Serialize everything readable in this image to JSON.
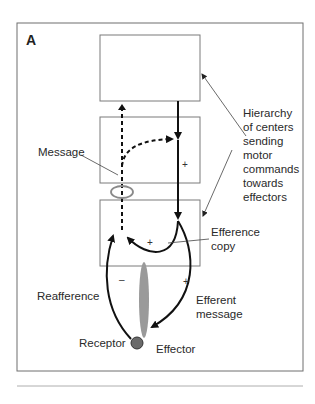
{
  "figure": {
    "panel_label": "A",
    "boxes": [
      {
        "id": "center-top",
        "level": 1
      },
      {
        "id": "center-middle",
        "level": 2
      },
      {
        "id": "center-bottom",
        "level": 3
      }
    ],
    "labels": {
      "message": "Message",
      "hierarchy": [
        "Hierarchy",
        "of centers",
        "sending",
        "motor",
        "commands",
        "towards",
        "effectors"
      ],
      "efference_copy": [
        "Efference",
        "copy"
      ],
      "reafference": "Reafference",
      "efferent_message": [
        "Efferent",
        "message"
      ],
      "effector": "Effector",
      "receptor": "Receptor"
    },
    "signs": {
      "middle_box_plus": "+",
      "efference_copy_plus": "+",
      "reafference_minus": "–",
      "efferent_plus": "+"
    },
    "colors": {
      "frame": "#6f6f6f",
      "box": "#7a7a7a",
      "arrow": "#111111",
      "effector_fill": "#9a9a9a",
      "receptor_fill": "#6a6a6a",
      "comparator_ellipse": "#8a8a8a"
    }
  }
}
